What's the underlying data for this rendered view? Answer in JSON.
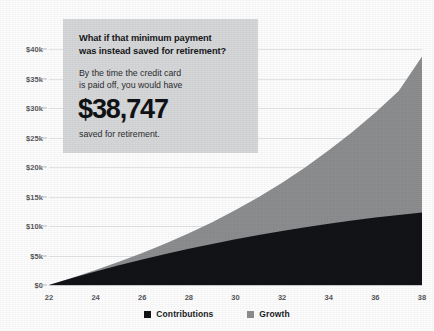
{
  "callout": {
    "headline_line1": "What if that minimum payment",
    "headline_line2": "was instead saved for retirement?",
    "body_line1": "By the time the credit card",
    "body_line2": "is paid off, you would have",
    "amount": "$38,747",
    "footer": "saved for retirement."
  },
  "colors": {
    "contributions": "#121316",
    "growth": "#8c8d8f",
    "callout_bg": "#d6d7d9",
    "grid": "#e3e4e6",
    "axis_text": "#55585c",
    "page_bg": "#fdfdfd"
  },
  "legend": {
    "items": [
      {
        "label": "Contributions",
        "color": "#121316"
      },
      {
        "label": "Growth",
        "color": "#8c8d8f"
      }
    ]
  },
  "chart_data": {
    "type": "area",
    "stacked": true,
    "title": "",
    "xlabel": "",
    "ylabel": "",
    "xlim": [
      22,
      38
    ],
    "ylim": [
      0,
      40000
    ],
    "grid": true,
    "legend_position": "bottom",
    "x_tick_labels": [
      "22",
      "24",
      "26",
      "28",
      "30",
      "32",
      "34",
      "36",
      "38"
    ],
    "x_tick_values": [
      22,
      24,
      26,
      28,
      30,
      32,
      34,
      36,
      38
    ],
    "y_tick_labels": [
      "$0",
      "$5k",
      "$10k",
      "$15k",
      "$20k",
      "$25k",
      "$30k",
      "$35k",
      "$40k"
    ],
    "y_tick_values": [
      0,
      5000,
      10000,
      15000,
      20000,
      25000,
      30000,
      35000,
      40000
    ],
    "x": [
      22,
      23,
      24,
      25,
      26,
      27,
      28,
      29,
      30,
      31,
      32,
      33,
      34,
      35,
      36,
      37,
      38
    ],
    "series": [
      {
        "name": "Contributions",
        "color": "#121316",
        "values": [
          0,
          1180,
          2290,
          3340,
          4330,
          5260,
          6140,
          6960,
          7740,
          8460,
          9140,
          9780,
          10370,
          10920,
          11420,
          11880,
          12290
        ]
      },
      {
        "name": "Growth",
        "color": "#8c8d8f",
        "values": [
          0,
          60,
          250,
          590,
          1090,
          1770,
          2630,
          3690,
          4960,
          6460,
          8200,
          10190,
          12450,
          14990,
          17830,
          21000,
          26457
        ]
      }
    ],
    "totals": [
      0,
      1240,
      2540,
      3930,
      5420,
      7030,
      8770,
      10650,
      12700,
      14920,
      17340,
      19970,
      22820,
      25910,
      29250,
      32880,
      38747
    ],
    "final_total": 38747,
    "annotation": "$38,747 saved for retirement"
  }
}
